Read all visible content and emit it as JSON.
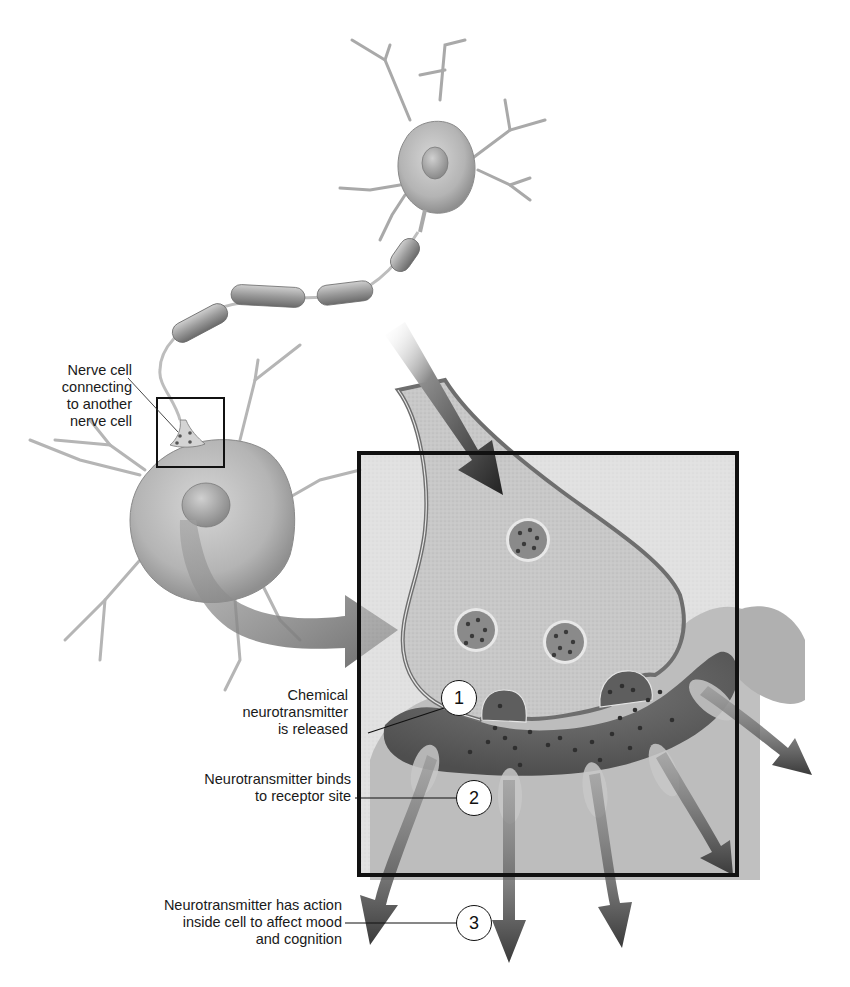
{
  "figure": {
    "inset_label": {
      "lines": [
        "Nerve cell",
        "connecting",
        "to another",
        "nerve cell"
      ]
    },
    "steps": [
      {
        "number": "1",
        "lines": [
          "Chemical",
          "neurotransmitter",
          "is released"
        ]
      },
      {
        "number": "2",
        "lines": [
          "Neurotransmitter binds",
          "to receptor site"
        ]
      },
      {
        "number": "3",
        "lines": [
          "Neurotransmitter has action",
          "inside cell to affect mood",
          "and cognition"
        ]
      }
    ],
    "colors": {
      "background": "#ffffff",
      "cell_fill": "#bdbdbd",
      "terminal_fill": "#c9c9c9",
      "membrane_dark": "#6e6e6e",
      "cleft_dark": "#5a5a5a",
      "arrow_dark": "#3a3a3a",
      "arrow_mid": "#7a7a7a",
      "box_stroke": "#111111",
      "text": "#1a1a1a"
    }
  }
}
